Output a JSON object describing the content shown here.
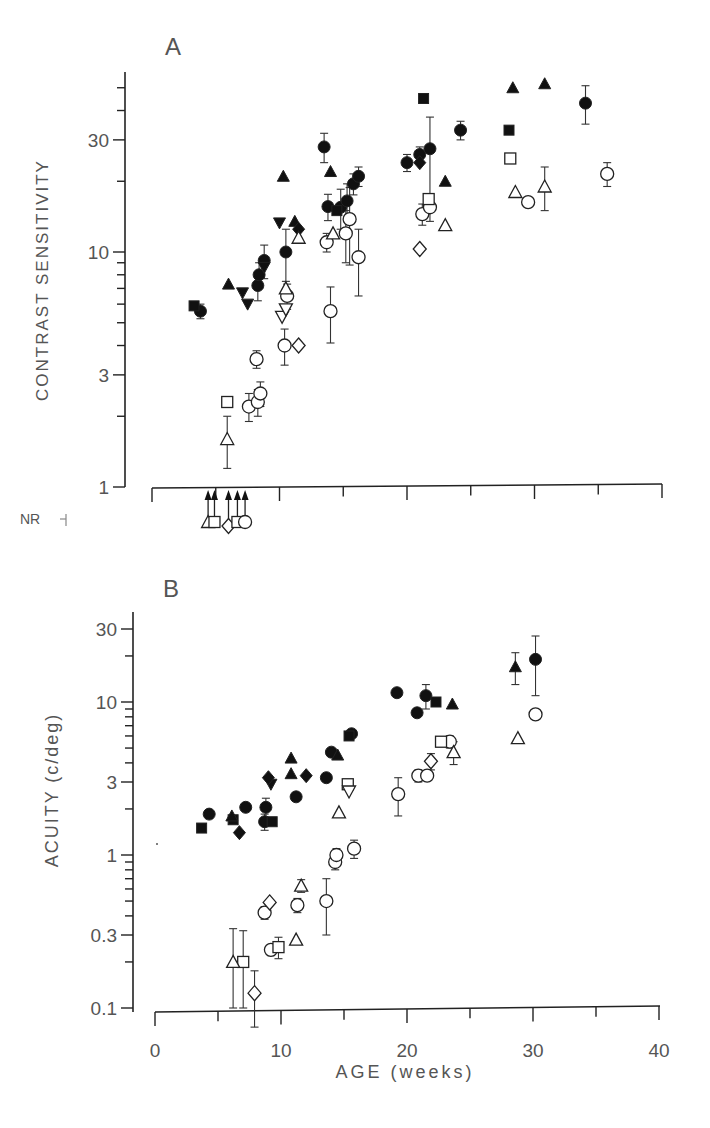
{
  "chart_data": [
    {
      "panel": "A",
      "type": "scatter",
      "title": "A",
      "xlabel": "",
      "ylabel": "CONTRAST SENSITIVITY",
      "yscale": "log",
      "ylim": [
        1,
        58
      ],
      "xlim": [
        0,
        40
      ],
      "yticks": [
        1,
        3,
        10,
        30
      ],
      "ytick_labels": [
        "1",
        "3",
        "10",
        "30"
      ],
      "below_axis_label": "NR",
      "grid": false,
      "legend": "none",
      "series": [
        {
          "name": "filled circles",
          "marker": "circle",
          "filled": true,
          "points": [
            [
              3.8,
              5.6
            ],
            [
              8.3,
              7.2
            ],
            [
              8.4,
              8
            ],
            [
              8.8,
              9.2
            ],
            [
              10.5,
              10
            ],
            [
              13.5,
              28
            ],
            [
              13.8,
              15.6
            ],
            [
              14.8,
              15.5
            ],
            [
              15.3,
              16.5
            ],
            [
              15.8,
              19.5
            ],
            [
              16.2,
              21
            ],
            [
              20,
              24
            ],
            [
              21,
              26
            ],
            [
              21.8,
              27.5
            ],
            [
              24.2,
              33
            ],
            [
              34,
              43
            ]
          ],
          "err": [
            0.4,
            1,
            1,
            1.5,
            2.5,
            4,
            2,
            3,
            3,
            2,
            2,
            2,
            2,
            10,
            3,
            8
          ]
        },
        {
          "name": "filled squares",
          "marker": "square",
          "filled": true,
          "points": [
            [
              3.3,
              5.9
            ],
            [
              14.5,
              15
            ],
            [
              21.3,
              45
            ],
            [
              28,
              33
            ]
          ]
        },
        {
          "name": "filled triangles",
          "marker": "triangle-up",
          "filled": true,
          "points": [
            [
              6,
              7.3
            ],
            [
              10.3,
              21
            ],
            [
              11.2,
              13.5
            ],
            [
              14,
              22
            ],
            [
              23,
              20
            ],
            [
              28.3,
              50
            ],
            [
              30.8,
              52
            ]
          ]
        },
        {
          "name": "filled inverted triangles",
          "marker": "triangle-down",
          "filled": true,
          "points": [
            [
              7.1,
              6.7
            ],
            [
              7.5,
              6
            ],
            [
              8.8,
              8.6
            ],
            [
              10,
              13.3
            ]
          ]
        },
        {
          "name": "filled diamonds",
          "marker": "diamond",
          "filled": true,
          "points": [
            [
              11.5,
              12.5
            ],
            [
              21,
              24
            ]
          ]
        },
        {
          "name": "open circles",
          "marker": "circle",
          "filled": false,
          "points": [
            [
              8.2,
              3.5
            ],
            [
              7.6,
              2.2
            ],
            [
              8.3,
              2.3
            ],
            [
              8.5,
              2.5
            ],
            [
              10.4,
              4
            ],
            [
              10.6,
              6.5
            ],
            [
              14,
              5.6
            ],
            [
              13.7,
              11
            ],
            [
              15.2,
              12
            ],
            [
              15.5,
              13.8
            ],
            [
              16.2,
              9.5
            ],
            [
              21.2,
              14.5
            ],
            [
              21.8,
              15.5
            ],
            [
              29.5,
              16.3
            ],
            [
              35.7,
              21.5
            ]
          ],
          "err": [
            0.3,
            0.3,
            0.3,
            0.3,
            0.7,
            0.8,
            1.5,
            1,
            3,
            5,
            3,
            1.5,
            2,
            0,
            2.5
          ]
        },
        {
          "name": "open squares",
          "marker": "square",
          "filled": false,
          "points": [
            [
              5.9,
              2.3
            ],
            [
              21.7,
              16.8
            ],
            [
              28.1,
              25
            ]
          ]
        },
        {
          "name": "open triangles",
          "marker": "triangle-up",
          "filled": false,
          "points": [
            [
              5.9,
              1.6
            ],
            [
              10.5,
              7
            ],
            [
              11.5,
              11.5
            ],
            [
              14.2,
              12
            ],
            [
              23,
              13
            ],
            [
              28.5,
              18
            ],
            [
              30.8,
              19
            ]
          ],
          "err": [
            0.4,
            0,
            0,
            0,
            0,
            0,
            4
          ]
        },
        {
          "name": "open inverted triangles",
          "marker": "triangle-down",
          "filled": false,
          "points": [
            [
              10.2,
              5.3
            ],
            [
              10.5,
              5.7
            ]
          ]
        },
        {
          "name": "open diamonds",
          "marker": "diamond",
          "filled": false,
          "points": [
            [
              11.5,
              4
            ],
            [
              21,
              10.3
            ]
          ]
        },
        {
          "name": "no response (NR) arrows",
          "marker": "arrow-up",
          "filled": true,
          "points_x": [
            4.4,
            4.9,
            6.0,
            6.7,
            7.3
          ]
        }
      ]
    },
    {
      "panel": "B",
      "type": "scatter",
      "title": "B",
      "xlabel": "AGE (weeks)",
      "ylabel": "ACUITY (c/deg)",
      "yscale": "log",
      "ylim": [
        0.1,
        38
      ],
      "xlim": [
        0,
        40
      ],
      "xticks": [
        0,
        10,
        20,
        30,
        40
      ],
      "xtick_labels": [
        "0",
        "10",
        "20",
        "30",
        "40"
      ],
      "yticks": [
        0.1,
        0.3,
        1,
        3,
        10,
        30
      ],
      "ytick_labels": [
        "0.1",
        "0.3",
        "1",
        "3",
        "10",
        "30"
      ],
      "grid": false,
      "legend": "none",
      "series": [
        {
          "name": "filled circles",
          "marker": "circle",
          "filled": true,
          "points": [
            [
              4.3,
              1.85
            ],
            [
              7.2,
              2.05
            ],
            [
              8.7,
              1.65
            ],
            [
              8.8,
              2.05
            ],
            [
              11.2,
              2.4
            ],
            [
              13.6,
              3.2
            ],
            [
              14,
              4.7
            ],
            [
              15.6,
              6.2
            ],
            [
              19.2,
              11.5
            ],
            [
              20.8,
              8.5
            ],
            [
              21.5,
              11
            ],
            [
              30.2,
              19
            ]
          ],
          "err": [
            0,
            0,
            0.2,
            0.3,
            0,
            0,
            0,
            0,
            0,
            0,
            2,
            8
          ]
        },
        {
          "name": "filled squares",
          "marker": "square",
          "filled": true,
          "points": [
            [
              3.7,
              1.5
            ],
            [
              6.2,
              1.7
            ],
            [
              9.3,
              1.65
            ],
            [
              15.4,
              6
            ],
            [
              22.3,
              10
            ]
          ]
        },
        {
          "name": "filled triangles",
          "marker": "triangle-up",
          "filled": true,
          "points": [
            [
              6.1,
              1.8
            ],
            [
              10.8,
              4.3
            ],
            [
              10.8,
              3.4
            ],
            [
              14.5,
              4.5
            ],
            [
              23.6,
              9.7
            ],
            [
              28.6,
              17
            ]
          ],
          "err": [
            0,
            0,
            0,
            0,
            0,
            4
          ]
        },
        {
          "name": "filled inverted triangles",
          "marker": "triangle-down",
          "filled": true,
          "points": [
            [
              9.2,
              2.9
            ]
          ]
        },
        {
          "name": "filled diamonds",
          "marker": "diamond",
          "filled": true,
          "points": [
            [
              6.7,
              1.4
            ],
            [
              9,
              3.2
            ],
            [
              12,
              3.3
            ]
          ]
        },
        {
          "name": "open circles",
          "marker": "circle",
          "filled": false,
          "points": [
            [
              8.7,
              0.42
            ],
            [
              9.2,
              0.24
            ],
            [
              11.3,
              0.47
            ],
            [
              13.6,
              0.5
            ],
            [
              14.3,
              0.9
            ],
            [
              14.4,
              1.0
            ],
            [
              15.8,
              1.1
            ],
            [
              19.3,
              2.5
            ],
            [
              20.9,
              3.3
            ],
            [
              21.6,
              3.3
            ],
            [
              23.4,
              5.5
            ],
            [
              30.2,
              8.3
            ]
          ],
          "err": [
            0.04,
            0.02,
            0.05,
            0.2,
            0.1,
            0.1,
            0.15,
            0.7,
            0.3,
            0,
            0.5,
            0
          ]
        },
        {
          "name": "open squares",
          "marker": "square",
          "filled": false,
          "points": [
            [
              7.0,
              0.2
            ],
            [
              9.8,
              0.25
            ],
            [
              15.3,
              2.9
            ],
            [
              22.7,
              5.5
            ]
          ],
          "err": [
            0.12,
            0.04,
            0,
            0
          ]
        },
        {
          "name": "open triangles",
          "marker": "triangle-up",
          "filled": false,
          "points": [
            [
              6.2,
              0.2
            ],
            [
              11.2,
              0.28
            ],
            [
              11.6,
              0.63
            ],
            [
              14.6,
              1.9
            ],
            [
              23.7,
              4.7
            ],
            [
              28.8,
              5.8
            ]
          ],
          "err": [
            0.13,
            0,
            0.06,
            0,
            0.8,
            0
          ]
        },
        {
          "name": "open inverted triangles",
          "marker": "triangle-down",
          "filled": false,
          "points": [
            [
              15.4,
              2.6
            ]
          ]
        },
        {
          "name": "open diamonds",
          "marker": "diamond",
          "filled": false,
          "points": [
            [
              7.9,
              0.125
            ],
            [
              9.1,
              0.49
            ],
            [
              21.9,
              4.1
            ]
          ],
          "err": [
            0.05,
            0,
            0.5
          ]
        }
      ]
    }
  ],
  "panels": {
    "a": {
      "letter": "A",
      "ylabel": "CONTRAST SENSITIVITY",
      "nr_label": "NR",
      "ytick_labels": [
        "1",
        "3",
        "10",
        "30"
      ]
    },
    "b": {
      "letter": "B",
      "ylabel": "ACUITY (c/deg)",
      "ytick_labels": [
        "0.1",
        "0.3",
        "1",
        "3",
        "10",
        "30"
      ]
    },
    "xaxis": {
      "label": "AGE (weeks)",
      "tick_labels": [
        "0",
        "10",
        "20",
        "30",
        "40"
      ]
    }
  }
}
